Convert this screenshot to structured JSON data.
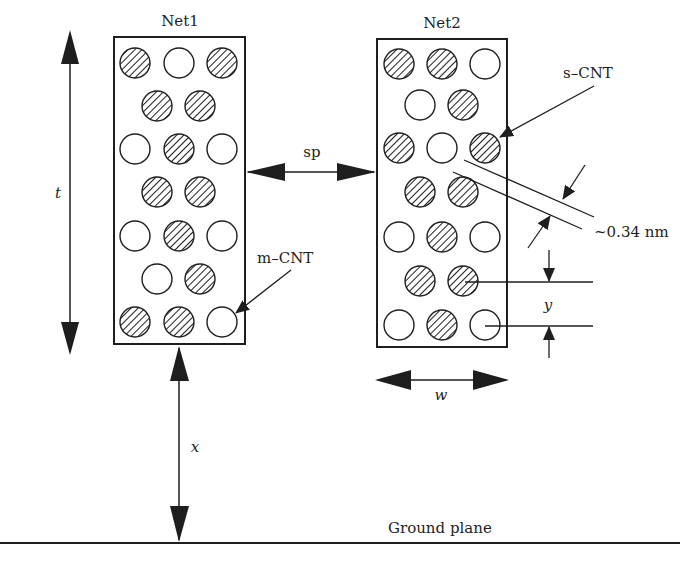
{
  "figure": {
    "type": "cross-section schematic of two CNT bundle interconnects above a ground plane",
    "colors": {
      "line": "#1e1e1e",
      "background": "#ffffff"
    }
  },
  "nets": [
    {
      "label": "Net1",
      "box": {
        "x": 114,
        "y": 37,
        "w": 131,
        "h": 307
      },
      "rows": [
        [
          "s",
          "m",
          "s"
        ],
        [
          "s",
          "s"
        ],
        [
          "m",
          "s",
          "m"
        ],
        [
          "s",
          "s"
        ],
        [
          "m",
          "s",
          "m"
        ],
        [
          "m",
          "s"
        ],
        [
          "s",
          "s",
          "m"
        ]
      ]
    },
    {
      "label": "Net2",
      "box": {
        "x": 377,
        "y": 39,
        "w": 130,
        "h": 308
      },
      "rows": [
        [
          "s",
          "s",
          "m"
        ],
        [
          "m",
          "s"
        ],
        [
          "s",
          "m",
          "s"
        ],
        [
          "s",
          "s"
        ],
        [
          "m",
          "s",
          "m"
        ],
        [
          "s",
          "s"
        ],
        [
          "m",
          "s",
          "m"
        ]
      ]
    }
  ],
  "legend": {
    "s": "s-CNT (semiconducting, hatched)",
    "m": "m-CNT (metallic, open)"
  },
  "annotations": {
    "s_cnt": "s–CNT",
    "m_cnt": "m–CNT",
    "spacing": "~0.34 nm",
    "ground": "Ground plane"
  },
  "dimensions": {
    "t": "t",
    "sp": "sp",
    "w": "w",
    "x": "x",
    "y": "y"
  }
}
